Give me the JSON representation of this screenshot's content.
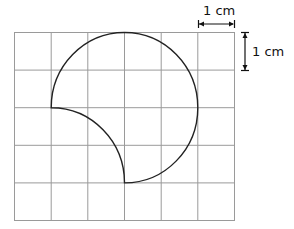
{
  "diagram": {
    "type": "grid-figure",
    "grid": {
      "columns": 6,
      "rows": 5,
      "cell_size": "1 cm",
      "line_color": "#9a9a9a"
    },
    "shape": {
      "description": "Three-quarter circle of radius 2 cm with a concave quarter-circle bite of radius 2 cm",
      "outer_arc": {
        "center": [
          3,
          2
        ],
        "radius": 2,
        "from": [
          1,
          2
        ],
        "to": [
          3,
          4
        ],
        "sweep_degrees": 270
      },
      "inner_arc": {
        "center": [
          1,
          4
        ],
        "radius": 2,
        "from": [
          1,
          2
        ],
        "to": [
          3,
          4
        ],
        "sweep_degrees": 90
      },
      "stroke_color": "#222222"
    },
    "scale_labels": {
      "horizontal": "1 cm",
      "vertical": "1 cm"
    }
  }
}
